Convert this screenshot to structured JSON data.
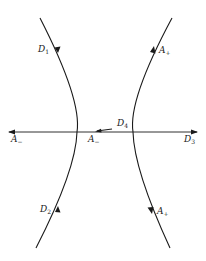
{
  "diagram": {
    "colors": {
      "stroke": "#1a1a1a",
      "background": "#ffffff"
    },
    "labels": {
      "d1": {
        "base": "D",
        "sub": "1"
      },
      "d2": {
        "base": "D",
        "sub": "2"
      },
      "a_plus_top": {
        "base": "A",
        "sub": "+"
      },
      "a_plus_bottom": {
        "base": "A",
        "sub": "+"
      },
      "a_minus_left": {
        "base": "A",
        "sub": "−"
      },
      "a_minus_center": {
        "base": "A",
        "sub": "−"
      },
      "d4": {
        "base": "D",
        "sub": "4"
      },
      "d3": {
        "base": "D",
        "sub": "3"
      }
    }
  }
}
